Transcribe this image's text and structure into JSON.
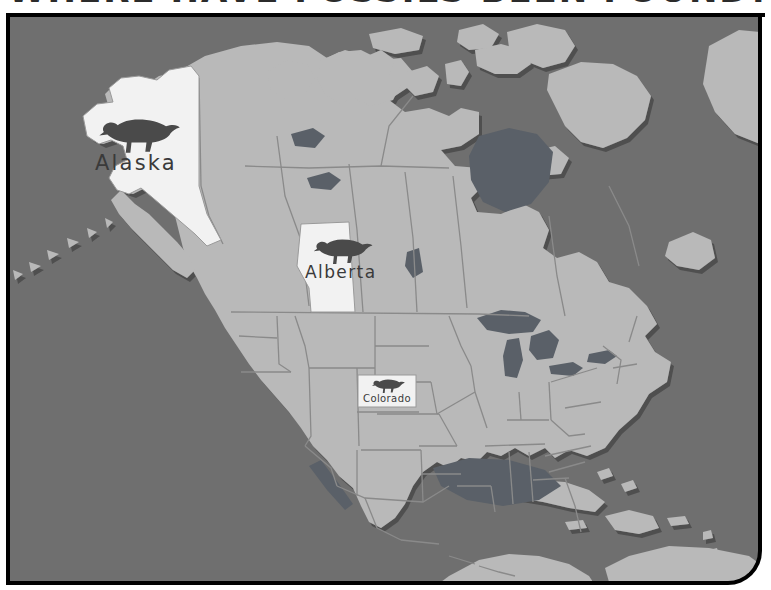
{
  "page": {
    "title": "WHERE HAVE FOSSILS BEEN FOUND?",
    "title_visible_fragment": "OSSILS BEEN FOUND?",
    "kind": "educational-map"
  },
  "colors": {
    "ocean": "#6f6f6f",
    "land": "#b9b9b9",
    "land_shadow": "#5c5c5c",
    "highlight": "#f2f2f2",
    "border_line": "#8a8a8a",
    "lakes": "#5a5f66",
    "frame": "#000000",
    "band": "#ffffff",
    "ink": "#333333"
  },
  "map": {
    "name": "north-america",
    "regions": [
      {
        "id": "alaska",
        "label": "Alaska",
        "highlighted": true,
        "has_fossil_marker": true
      },
      {
        "id": "alberta",
        "label": "Alberta",
        "highlighted": true,
        "has_fossil_marker": true
      },
      {
        "id": "colorado",
        "label": "Colorado",
        "highlighted": true,
        "has_fossil_marker": true
      }
    ],
    "marker_icon": "hadrosaur-dinosaur-icon",
    "marker_count": 3
  },
  "labels": {
    "alaska": "Alaska",
    "alberta": "Alberta",
    "colorado": "Colorado"
  }
}
